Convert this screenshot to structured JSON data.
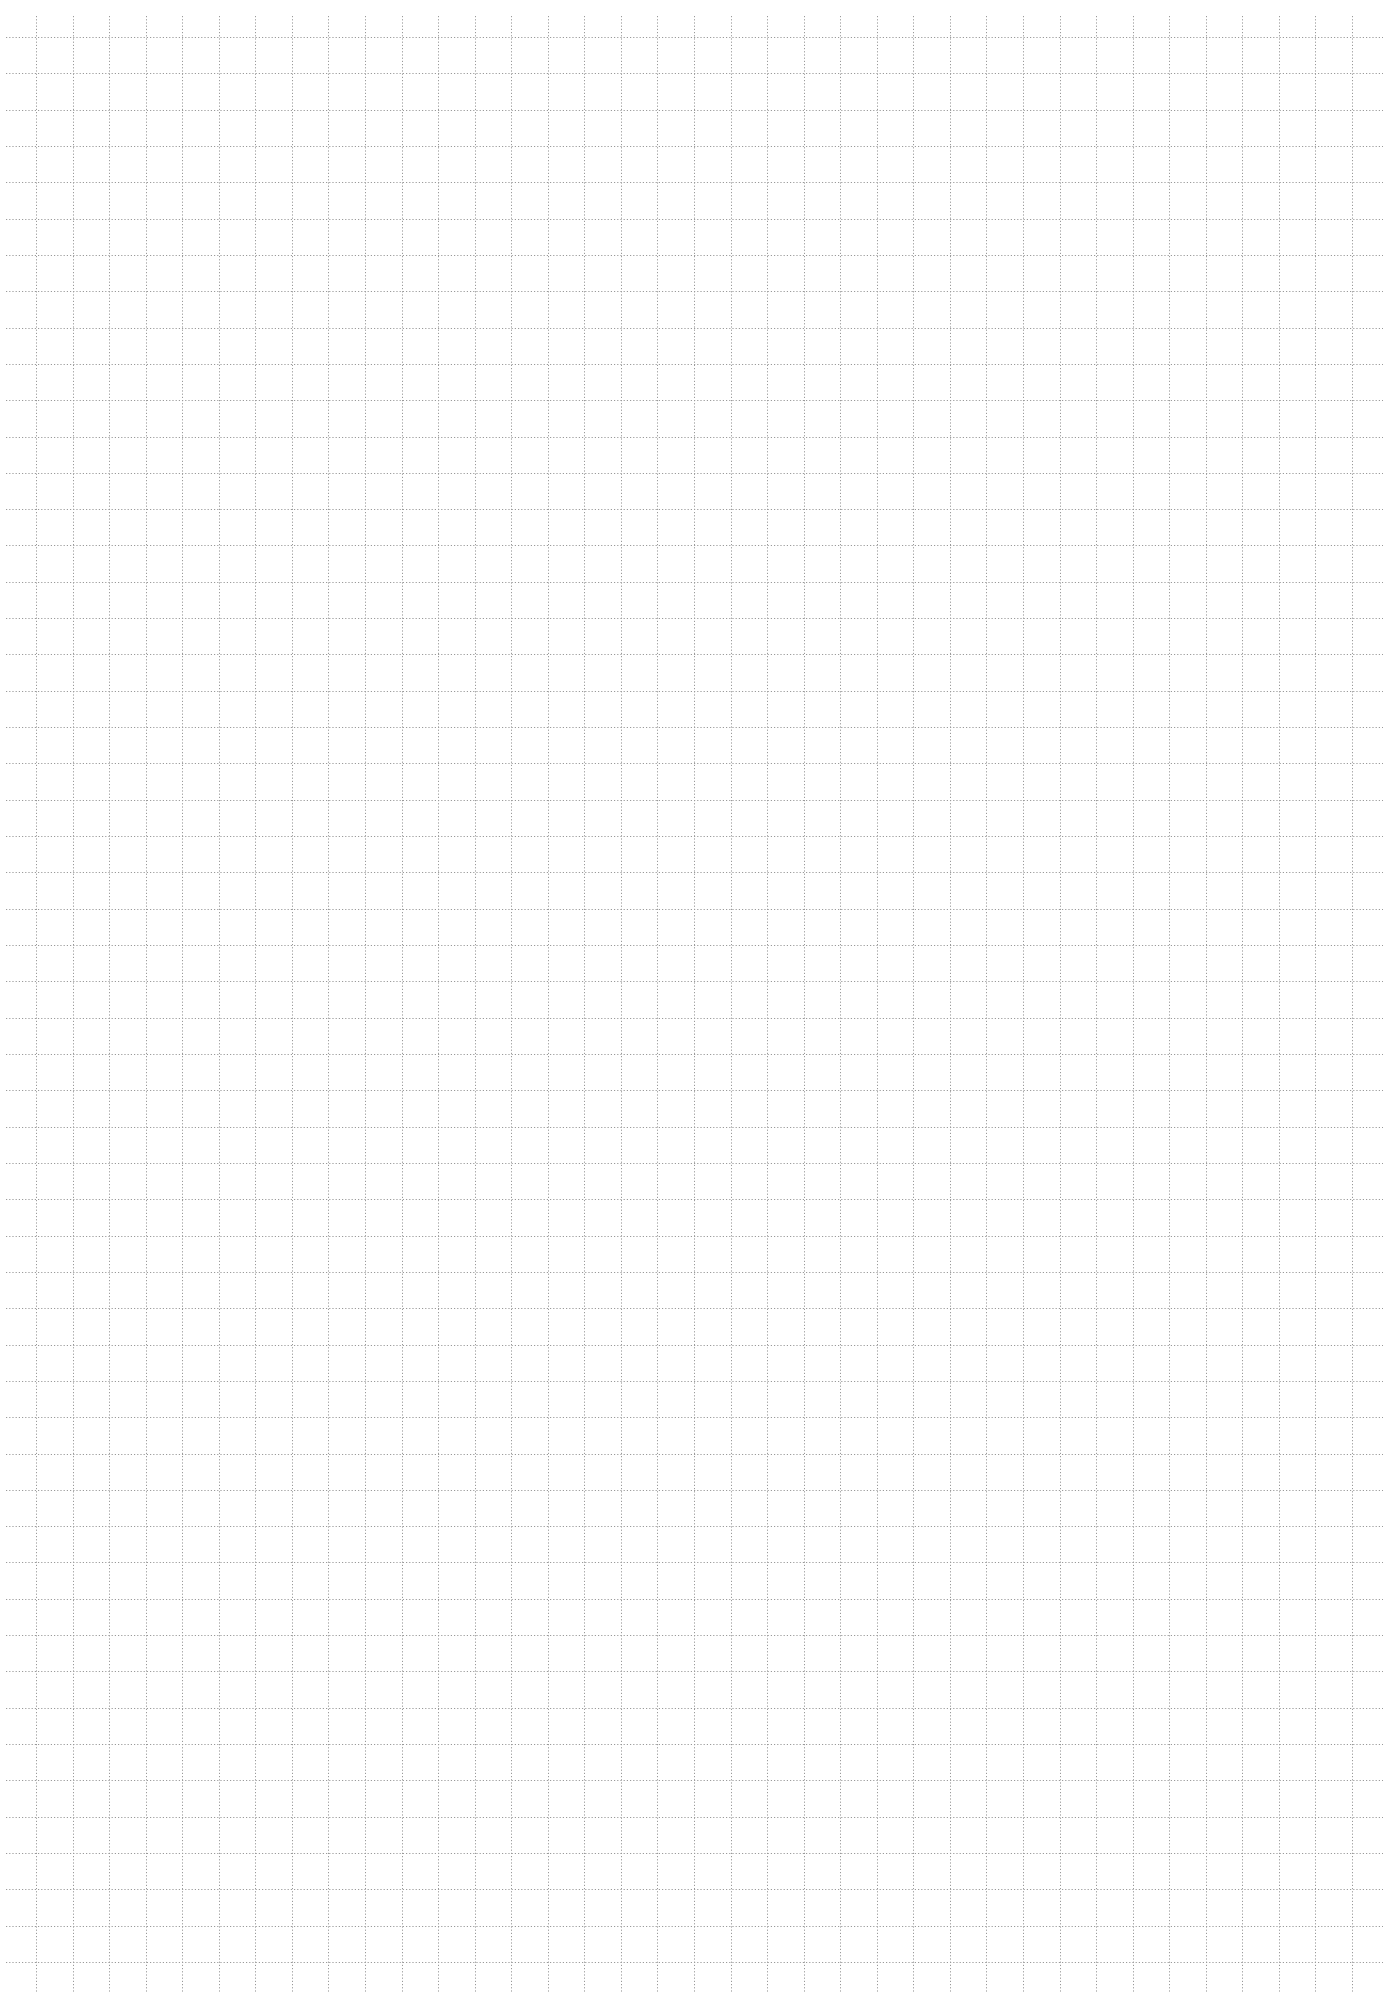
{
  "page": {
    "type": "grid-paper",
    "width": 1385,
    "height": 2000,
    "background": "#ffffff",
    "line_color": "#9a9a9a",
    "line_style": "dotted"
  },
  "grid": {
    "cell_size": 36.57,
    "vertical_first_x": 36,
    "vertical_last_x": 1352,
    "horizontal_first_y": 37,
    "horizontal_last_y": 1962,
    "horizontal_line_start_x": 6,
    "horizontal_line_end_x": 1383,
    "vertical_line_start_y": 16,
    "vertical_line_end_y": 1992
  }
}
